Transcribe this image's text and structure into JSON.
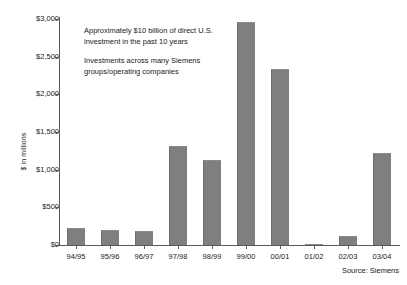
{
  "chart_data": {
    "type": "bar",
    "title": "",
    "subtitle": "",
    "xlabel": "",
    "ylabel": "$ in millions",
    "categories": [
      "94/95",
      "95/96",
      "96/97",
      "97/98",
      "98/99",
      "99/00",
      "00/01",
      "01/02",
      "02/03",
      "03/04"
    ],
    "values": [
      225,
      200,
      185,
      1315,
      1125,
      2960,
      2335,
      15,
      120,
      1220
    ],
    "series": [
      {
        "name": "Direct U.S. investment",
        "values": [
          225,
          200,
          185,
          1315,
          1125,
          2960,
          2335,
          15,
          120,
          1220
        ]
      }
    ],
    "ylim": [
      0,
      3000
    ],
    "ytick_values": [
      0,
      500,
      1000,
      1500,
      2000,
      2500,
      3000
    ],
    "ytick_labels": [
      "$0",
      "$500",
      "$1,000",
      "$1,500",
      "$2,000",
      "$2,500",
      "$3,000"
    ],
    "grid": false,
    "legend": false,
    "legend_position": "none",
    "bar_color": "#7f7f7f",
    "axis_color": "#5a5a5a",
    "background_color": "#ffffff",
    "annotations": [
      "Approximately $10 billion of direct U.S. investment in the past 10 years",
      "Investments across many Siemens groups/operating companies"
    ],
    "source": "Source: Siemens"
  },
  "axis": {
    "y_title": "$ in millions"
  },
  "notes": {
    "annotation_1_line_1": "Approximately $10 billion of direct U.S.",
    "annotation_1_line_2": "investment in the past 10 years",
    "annotation_2_line_1": "Investments across many Siemens",
    "annotation_2_line_2": "groups/operating companies"
  },
  "footer": {
    "source": "Source: Siemens"
  }
}
